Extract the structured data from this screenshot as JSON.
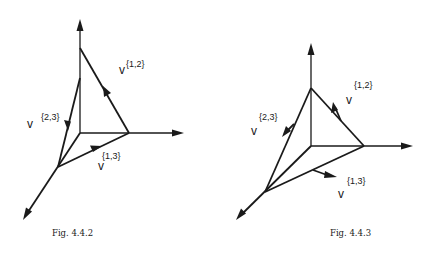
{
  "figures": [
    {
      "caption": "Fig. 4.4.2",
      "labels": {
        "v12_base": "v",
        "v12_sup": "{1,2}",
        "v23_base": "v",
        "v23_sup": "{2,3}",
        "v13_base": "v",
        "v13_sup": "{1,3}"
      }
    },
    {
      "caption": "Fig. 4.4.3",
      "labels": {
        "v12_base": "v",
        "v12_sup": "{1,2}",
        "v23_base": "v",
        "v23_sup": "{2,3}",
        "v13_base": "v",
        "v13_sup": "{1,3}"
      }
    }
  ],
  "colors": {
    "ink": "#1a1a1a",
    "background": "#ffffff"
  }
}
